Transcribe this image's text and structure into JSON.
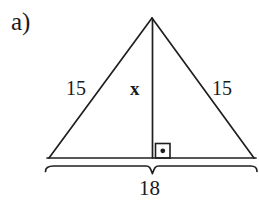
{
  "figure": {
    "part_label": "a)",
    "shape": "isosceles-triangle-with-altitude",
    "labels": {
      "left_side": "15",
      "right_side": "15",
      "altitude": "x",
      "base": "18"
    },
    "markers": {
      "right_angle": "right-angle-square-with-dot",
      "base_brace": "curly-brace-under-base"
    },
    "colors": {
      "ink": "#1a1a1a",
      "background": "#ffffff"
    }
  },
  "geometry": {
    "apex": {
      "x": 152,
      "y": 18
    },
    "base_left": {
      "x": 49,
      "y": 158
    },
    "base_right": {
      "x": 254,
      "y": 158
    },
    "foot_of_altitude": {
      "x": 152,
      "y": 158
    },
    "right_angle_box": {
      "x": 155,
      "y": 143,
      "size": 15
    },
    "brace": {
      "left": 44,
      "right": 257,
      "top": 166,
      "tip_x": 152,
      "tip_y": 174
    }
  }
}
